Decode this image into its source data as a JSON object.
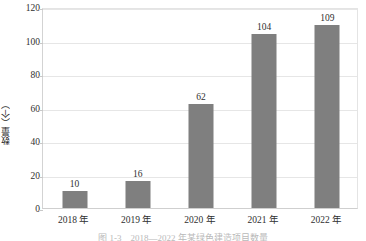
{
  "chart_data": {
    "type": "bar",
    "title": "",
    "categories": [
      "2018 年",
      "2019 年",
      "2020 年",
      "2021 年",
      "2022 年"
    ],
    "values": [
      10,
      16,
      62,
      104,
      109
    ],
    "series": [
      {
        "name": "数量",
        "values": [
          10,
          16,
          62,
          104,
          109
        ]
      }
    ],
    "xlabel": "",
    "ylabel": "数量（个）",
    "ylim": [
      0,
      120
    ],
    "yticks": [
      0,
      20,
      40,
      60,
      80,
      100,
      120
    ],
    "ytick_labels": [
      "0",
      "20",
      "40",
      "60",
      "80",
      "100",
      "120"
    ],
    "data_labels": [
      "10",
      "16",
      "62",
      "104",
      "109"
    ],
    "grid": true,
    "legend": "none",
    "bar_color": "#7f7f7f",
    "gridline_color": "#e6e6e6",
    "axis_color": "#cfcfcf",
    "text_color": "#2f2f2f",
    "background": "#ffffff"
  },
  "caption": {
    "text": "图 1-3　2018—2022 年某绿色建造项目数量"
  }
}
